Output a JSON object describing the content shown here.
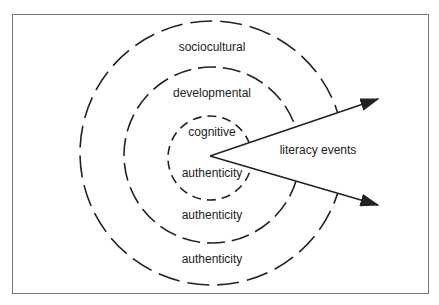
{
  "diagram": {
    "rings": [
      {
        "name": "sociocultural",
        "label_top": "sociocultural",
        "label_bottom": "authenticity"
      },
      {
        "name": "developmental",
        "label_top": "developmental",
        "label_bottom": "authenticity"
      },
      {
        "name": "cognitive",
        "label_top": "cognitive",
        "label_bottom": "authenticity"
      }
    ],
    "arrow_label": "literacy events"
  }
}
